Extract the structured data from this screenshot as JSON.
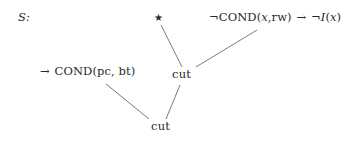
{
  "diagram": {
    "set_label": "S:",
    "nodes": [
      {
        "id": "star",
        "kind": "star",
        "label": "★",
        "icon": "star-icon",
        "x": 154,
        "y": 13
      },
      {
        "id": "clause-right",
        "kind": "clause",
        "label": "¬COND(x,rw) → ¬I(x)",
        "parts": [
          {
            "text": "¬COND(",
            "style": "roman"
          },
          {
            "text": "x",
            "style": "italic"
          },
          {
            "text": ",rw) ",
            "style": "roman"
          },
          {
            "text": "→",
            "style": "arrow"
          },
          {
            "text": " ¬",
            "style": "roman"
          },
          {
            "text": "I",
            "style": "italic"
          },
          {
            "text": "(",
            "style": "roman"
          },
          {
            "text": "x",
            "style": "italic"
          },
          {
            "text": ")",
            "style": "roman"
          }
        ],
        "x": 209,
        "y": 12
      },
      {
        "id": "clause-left",
        "kind": "clause",
        "label": "→ COND(pc, bt)",
        "parts": [
          {
            "text": "→",
            "style": "arrow"
          },
          {
            "text": " COND(pc, bt)",
            "style": "roman"
          }
        ],
        "x": 39,
        "y": 66
      },
      {
        "id": "cut-middle",
        "kind": "cut",
        "label": "cut",
        "x": 172,
        "y": 69
      },
      {
        "id": "cut-bottom",
        "kind": "cut",
        "label": "cut",
        "x": 151,
        "y": 121
      }
    ],
    "edges": [
      {
        "id": "edge-star-cutmiddle",
        "from": "star",
        "to": "cut-middle",
        "x1": 161,
        "y1": 25,
        "x2": 182,
        "y2": 67
      },
      {
        "id": "edge-clauseright-cutmiddle",
        "from": "clause-right",
        "to": "cut-middle",
        "x1": 257,
        "y1": 30,
        "x2": 196,
        "y2": 67
      },
      {
        "id": "edge-clauseleft-cutbottom",
        "from": "clause-left",
        "to": "cut-bottom",
        "x1": 106,
        "y1": 84,
        "x2": 149,
        "y2": 119
      },
      {
        "id": "edge-cutmiddle-cutbottom",
        "from": "cut-middle",
        "to": "cut-bottom",
        "x1": 180,
        "y1": 85,
        "x2": 166,
        "y2": 119
      }
    ],
    "style": {
      "edge_color": "#6b6b6b",
      "text_color": "#2a2a2a",
      "background": "#ffffff",
      "edge_width": 0.9
    }
  }
}
